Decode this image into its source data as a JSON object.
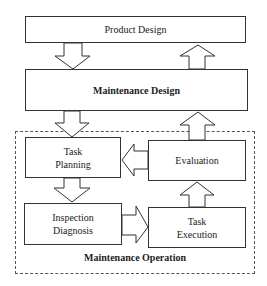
{
  "diagram": {
    "boxes": {
      "product_design": "Product Design",
      "maintenance_design": "Maintenance Design",
      "task_planning_line1": "Task",
      "task_planning_line2": "Planning",
      "evaluation": "Evaluation",
      "inspection_line1": "Inspection",
      "inspection_line2": "Diagnosis",
      "task_execution_line1": "Task",
      "task_execution_line2": "Execution"
    },
    "group_label": "Maintenance Operation",
    "arrows": [
      {
        "from": "Product Design",
        "to": "Maintenance Design",
        "direction": "down"
      },
      {
        "from": "Maintenance Design",
        "to": "Product Design",
        "direction": "up"
      },
      {
        "from": "Maintenance Design",
        "to": "Task Planning",
        "direction": "down"
      },
      {
        "from": "Evaluation",
        "to": "Maintenance Design",
        "direction": "up"
      },
      {
        "from": "Evaluation",
        "to": "Task Planning",
        "direction": "left"
      },
      {
        "from": "Task Planning",
        "to": "Inspection Diagnosis",
        "direction": "down"
      },
      {
        "from": "Inspection Diagnosis",
        "to": "Task Execution",
        "direction": "right"
      },
      {
        "from": "Task Execution",
        "to": "Evaluation",
        "direction": "up"
      }
    ]
  }
}
